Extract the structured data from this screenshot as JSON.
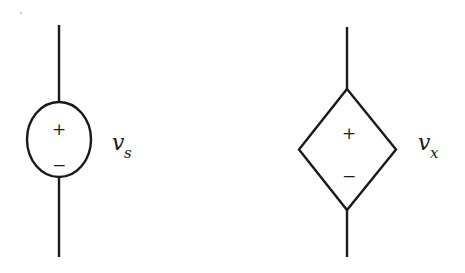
{
  "diagram": {
    "type": "circuit-symbols",
    "elements": [
      {
        "id": "independent-voltage-source",
        "shape": "circle",
        "plus_sign": "+",
        "minus_sign": "−",
        "label_main": "v",
        "label_sub": "s"
      },
      {
        "id": "dependent-voltage-source",
        "shape": "diamond",
        "plus_sign": "+",
        "minus_sign": "−",
        "label_main": "v",
        "label_sub": "x"
      }
    ],
    "colors": {
      "stroke": "#1a1a1a",
      "background": "#ffffff"
    }
  }
}
